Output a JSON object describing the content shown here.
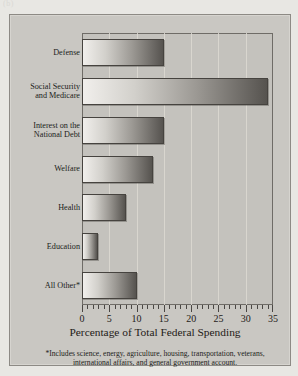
{
  "figure": {
    "tag": "(b)"
  },
  "chart_data": {
    "type": "bar",
    "orientation": "horizontal",
    "title": "",
    "xlabel": "Percentage of Total Federal Spending",
    "ylabel": "",
    "xlim": [
      0,
      35
    ],
    "xticks": [
      0,
      5,
      10,
      15,
      20,
      25,
      30,
      35
    ],
    "xtick_labels": [
      "0",
      "5",
      "10",
      "15",
      "20",
      "25",
      "30",
      "35"
    ],
    "minor_tick_interval": 1,
    "grid": true,
    "grid_axis": "x",
    "legend": false,
    "categories": [
      "Defense",
      "Social Security and Medicare",
      "Interest on the National Debt",
      "Welfare",
      "Health",
      "Education",
      "All Other*"
    ],
    "values": [
      15,
      34,
      15,
      13,
      8,
      3,
      10
    ],
    "bar_fill": "linear-gradient light-to-dark gray",
    "bar_edge_color": "#46433f",
    "plot_background": "#c4c2bd",
    "panel_background": "#c9c7c2"
  },
  "labels": {
    "categories": [
      {
        "lines": [
          "Defense"
        ]
      },
      {
        "lines": [
          "Social Security",
          "and Medicare"
        ]
      },
      {
        "lines": [
          "Interest on the",
          "National Debt"
        ]
      },
      {
        "lines": [
          "Welfare"
        ]
      },
      {
        "lines": [
          "Health"
        ]
      },
      {
        "lines": [
          "Education"
        ]
      },
      {
        "lines": [
          "All Other*"
        ]
      }
    ]
  },
  "footnote": {
    "text": "*Includes science, energy, agriculture, housing, transportation, veterans, international affairs, and general government account."
  }
}
